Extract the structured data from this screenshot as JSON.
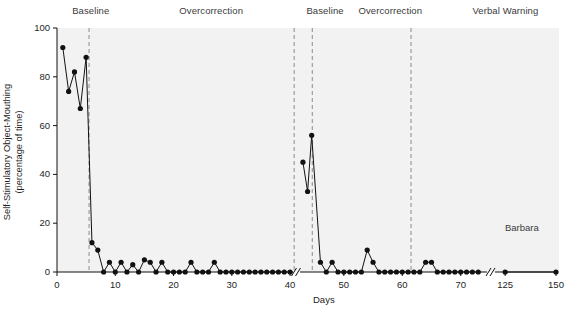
{
  "chart_data": {
    "type": "line",
    "title": "",
    "subject": "Barbara",
    "xlabel": "Days",
    "ylabel_line1": "Self-Stimulatory Object-Mouthing",
    "ylabel_line2": "(percentage of time)",
    "ylim": [
      0,
      100
    ],
    "yticks": [
      0,
      20,
      40,
      60,
      80,
      100
    ],
    "xticks": [
      0,
      10,
      20,
      30,
      40,
      50,
      60,
      70,
      125,
      150
    ],
    "grid": false,
    "axis_breaks": [
      {
        "after": 40.5,
        "before": 42.5
      },
      {
        "after": 74.5,
        "before": 120.0
      }
    ],
    "phases": [
      {
        "label": "Baseline",
        "start": 0,
        "end": 5.5,
        "label_x": 2.6
      },
      {
        "label": "Overcorrection",
        "start": 5.5,
        "end": 40.5,
        "label_x": 21.0
      },
      {
        "label": "Baseline",
        "start": 42.5,
        "end": 44.6,
        "label_x": 43.6
      },
      {
        "label": "Overcorrection",
        "start": 44.6,
        "end": 61.5,
        "label_x": 52.5
      },
      {
        "label": "Verbal Warning",
        "start": 61.5,
        "end": 150,
        "label_x": 72.0
      }
    ],
    "phase_line_days": [
      5.5,
      41.5,
      44.6,
      61.5
    ],
    "series": [
      {
        "name": "Barbara",
        "marker": "filled-circle",
        "color": "#111111",
        "points": [
          {
            "x": 1,
            "y": 92
          },
          {
            "x": 2,
            "y": 74
          },
          {
            "x": 3,
            "y": 82
          },
          {
            "x": 4,
            "y": 67
          },
          {
            "x": 5,
            "y": 88
          },
          {
            "x": 6,
            "y": 12
          },
          {
            "x": 7,
            "y": 9
          },
          {
            "x": 8,
            "y": 0
          },
          {
            "x": 9,
            "y": 4
          },
          {
            "x": 10,
            "y": 0
          },
          {
            "x": 11,
            "y": 4
          },
          {
            "x": 12,
            "y": 0
          },
          {
            "x": 13,
            "y": 3
          },
          {
            "x": 14,
            "y": 0
          },
          {
            "x": 15,
            "y": 5
          },
          {
            "x": 16,
            "y": 4
          },
          {
            "x": 17,
            "y": 0
          },
          {
            "x": 18,
            "y": 4
          },
          {
            "x": 19,
            "y": 0
          },
          {
            "x": 20,
            "y": 0
          },
          {
            "x": 21,
            "y": 0
          },
          {
            "x": 22,
            "y": 0
          },
          {
            "x": 23,
            "y": 4
          },
          {
            "x": 24,
            "y": 0
          },
          {
            "x": 25,
            "y": 0
          },
          {
            "x": 26,
            "y": 0
          },
          {
            "x": 27,
            "y": 4
          },
          {
            "x": 28,
            "y": 0
          },
          {
            "x": 29,
            "y": 0
          },
          {
            "x": 30,
            "y": 0
          },
          {
            "x": 31,
            "y": 0
          },
          {
            "x": 32,
            "y": 0
          },
          {
            "x": 33,
            "y": 0
          },
          {
            "x": 34,
            "y": 0
          },
          {
            "x": 35,
            "y": 0
          },
          {
            "x": 36,
            "y": 0
          },
          {
            "x": 37,
            "y": 0
          },
          {
            "x": 38,
            "y": 0
          },
          {
            "x": 39,
            "y": 0
          },
          {
            "x": 40,
            "y": 0
          },
          {
            "x": 43,
            "y": 45
          },
          {
            "x": 43.8,
            "y": 33
          },
          {
            "x": 44.5,
            "y": 56
          },
          {
            "x": 46,
            "y": 4
          },
          {
            "x": 47,
            "y": 0
          },
          {
            "x": 48,
            "y": 4
          },
          {
            "x": 49,
            "y": 0
          },
          {
            "x": 50,
            "y": 0
          },
          {
            "x": 51,
            "y": 0
          },
          {
            "x": 52,
            "y": 0
          },
          {
            "x": 53,
            "y": 0
          },
          {
            "x": 54,
            "y": 9
          },
          {
            "x": 55,
            "y": 4
          },
          {
            "x": 56,
            "y": 0
          },
          {
            "x": 57,
            "y": 0
          },
          {
            "x": 58,
            "y": 0
          },
          {
            "x": 59,
            "y": 0
          },
          {
            "x": 60,
            "y": 0
          },
          {
            "x": 61,
            "y": 0
          },
          {
            "x": 62,
            "y": 0
          },
          {
            "x": 63,
            "y": 0
          },
          {
            "x": 64,
            "y": 4
          },
          {
            "x": 65,
            "y": 4
          },
          {
            "x": 66,
            "y": 0
          },
          {
            "x": 67,
            "y": 0
          },
          {
            "x": 68,
            "y": 0
          },
          {
            "x": 69,
            "y": 0
          },
          {
            "x": 70,
            "y": 0
          },
          {
            "x": 71,
            "y": 0
          },
          {
            "x": 72,
            "y": 0
          },
          {
            "x": 73,
            "y": 0
          },
          {
            "x": 125,
            "y": 0
          },
          {
            "x": 150,
            "y": 0
          }
        ]
      }
    ]
  }
}
